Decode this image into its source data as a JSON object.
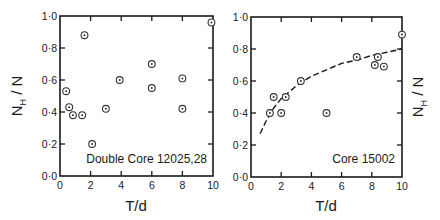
{
  "chart_data": [
    {
      "type": "scatter",
      "title": "",
      "annotation": "Double Core 12025,28",
      "xlabel": "T/d",
      "ylabel": "N_H / N",
      "xlim": [
        0,
        10
      ],
      "ylim": [
        0.0,
        1.0
      ],
      "xticks": [
        0,
        2,
        4,
        6,
        8,
        10
      ],
      "xtick_labels": [
        "0",
        "2",
        "4",
        "6",
        "8",
        "10"
      ],
      "yticks": [
        0.0,
        0.2,
        0.4,
        0.6,
        0.8,
        1.0
      ],
      "ytick_labels": [
        "0·0",
        "0·2",
        "0·4",
        "0·6",
        "0·8",
        "1·0"
      ],
      "grid": false,
      "marker": "circled-dot",
      "series": [
        {
          "name": "Double Core 12025,28",
          "x": [
            0.4,
            0.6,
            0.85,
            1.45,
            1.6,
            2.1,
            3.0,
            3.9,
            6.0,
            6.0,
            8.0,
            8.0,
            9.9
          ],
          "y": [
            0.53,
            0.43,
            0.38,
            0.38,
            0.88,
            0.2,
            0.42,
            0.6,
            0.7,
            0.55,
            0.61,
            0.42,
            0.96
          ]
        }
      ]
    },
    {
      "type": "scatter",
      "title": "",
      "annotation": "Core 15002",
      "xlabel": "T/d",
      "ylabel": "N_H / N",
      "xlim": [
        0,
        10
      ],
      "ylim": [
        0.0,
        1.0
      ],
      "xticks": [
        0,
        2,
        4,
        6,
        8,
        10
      ],
      "xtick_labels": [
        "0",
        "2",
        "4",
        "6",
        "8",
        "10"
      ],
      "yticks": [
        0.0,
        0.2,
        0.4,
        0.6,
        0.8,
        1.0
      ],
      "ytick_labels": [
        "0·0",
        "0·2",
        "0·4",
        "0·6",
        "0·8",
        "1·0"
      ],
      "grid": false,
      "marker": "circled-dot",
      "series": [
        {
          "name": "Core 15002",
          "x": [
            1.25,
            1.5,
            2.0,
            2.3,
            3.3,
            5.0,
            7.0,
            8.2,
            8.4,
            8.8,
            10.0
          ],
          "y": [
            0.4,
            0.5,
            0.4,
            0.5,
            0.6,
            0.4,
            0.75,
            0.7,
            0.75,
            0.69,
            0.89
          ]
        },
        {
          "name": "fitted curve (dashed)",
          "style": "dashed-line",
          "x": [
            0.6,
            1.0,
            1.5,
            2.0,
            2.5,
            3.0,
            4.0,
            5.0,
            6.0,
            7.0,
            8.0,
            9.0,
            10.0
          ],
          "y": [
            0.27,
            0.35,
            0.43,
            0.49,
            0.53,
            0.57,
            0.63,
            0.67,
            0.71,
            0.73,
            0.76,
            0.78,
            0.8
          ]
        }
      ]
    }
  ],
  "panels": [
    {
      "annotation": "Double Core 12025,28",
      "xlabel": "T/d",
      "ylabel_main": "N",
      "ylabel_sub": "H",
      "ylabel_rest": " / N"
    },
    {
      "annotation": "Core 15002",
      "xlabel": "T/d",
      "ylabel_main": "N",
      "ylabel_sub": "H",
      "ylabel_rest": " / N"
    }
  ]
}
